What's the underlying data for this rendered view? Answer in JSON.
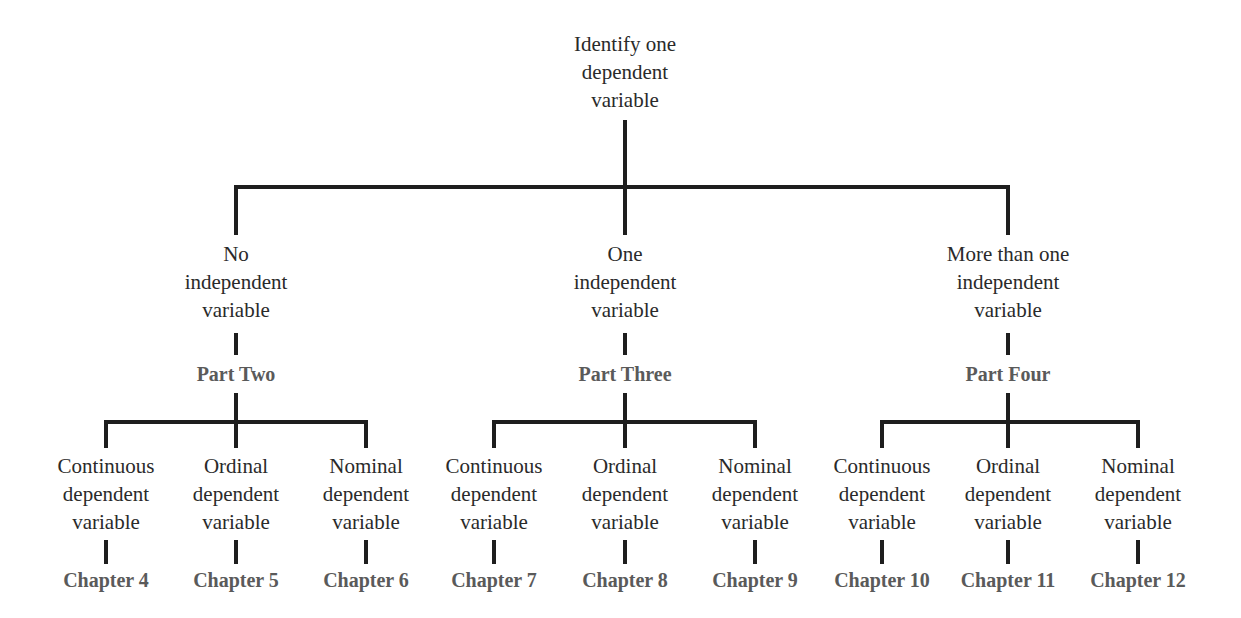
{
  "root": {
    "lines": [
      "Identify one",
      "dependent",
      "variable"
    ]
  },
  "branches": [
    {
      "lines": [
        "No",
        "independent",
        "variable"
      ],
      "part": "Part Two",
      "leaves": [
        {
          "lines": [
            "Continuous",
            "dependent",
            "variable"
          ],
          "chapter": "Chapter 4"
        },
        {
          "lines": [
            "Ordinal",
            "dependent",
            "variable"
          ],
          "chapter": "Chapter 5"
        },
        {
          "lines": [
            "Nominal",
            "dependent",
            "variable"
          ],
          "chapter": "Chapter 6"
        }
      ]
    },
    {
      "lines": [
        "One",
        "independent",
        "variable"
      ],
      "part": "Part Three",
      "leaves": [
        {
          "lines": [
            "Continuous",
            "dependent",
            "variable"
          ],
          "chapter": "Chapter 7"
        },
        {
          "lines": [
            "Ordinal",
            "dependent",
            "variable"
          ],
          "chapter": "Chapter 8"
        },
        {
          "lines": [
            "Nominal",
            "dependent",
            "variable"
          ],
          "chapter": "Chapter 9"
        }
      ]
    },
    {
      "lines": [
        "More than one",
        "independent",
        "variable"
      ],
      "part": "Part Four",
      "leaves": [
        {
          "lines": [
            "Continuous",
            "dependent",
            "variable"
          ],
          "chapter": "Chapter 10"
        },
        {
          "lines": [
            "Ordinal",
            "dependent",
            "variable"
          ],
          "chapter": "Chapter 11"
        },
        {
          "lines": [
            "Nominal",
            "dependent",
            "variable"
          ],
          "chapter": "Chapter 12"
        }
      ]
    }
  ],
  "colors": {
    "line": "#1e1e1e",
    "text": "#2a2a2a",
    "label": "#5a5a5a"
  }
}
